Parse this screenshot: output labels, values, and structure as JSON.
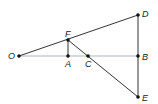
{
  "diagram": {
    "type": "geometry",
    "colors": {
      "line": "#333333",
      "baseline": "#a9b4c6",
      "point": "#111111",
      "label": "#222222"
    },
    "points": {
      "O": {
        "label": "O",
        "x": 19,
        "y": 56
      },
      "F": {
        "label": "F",
        "x": 68,
        "y": 40
      },
      "A": {
        "label": "A",
        "x": 68,
        "y": 56
      },
      "C": {
        "label": "C",
        "x": 88,
        "y": 56
      },
      "D": {
        "label": "D",
        "x": 138,
        "y": 15
      },
      "B": {
        "label": "B",
        "x": 138,
        "y": 56
      },
      "E": {
        "label": "E",
        "x": 138,
        "y": 97
      }
    },
    "segments": [
      [
        "O",
        "D"
      ],
      [
        "O",
        "B"
      ],
      [
        "F",
        "A"
      ],
      [
        "F",
        "E"
      ],
      [
        "D",
        "E"
      ]
    ]
  }
}
